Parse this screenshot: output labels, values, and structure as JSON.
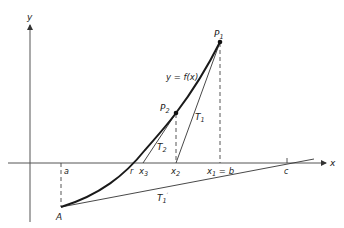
{
  "diagram": {
    "axes": {
      "x_label": "x",
      "y_label": "y"
    },
    "curve_label": "y = f(x)",
    "points": {
      "P1": {
        "label": "P",
        "sub": "1"
      },
      "P2": {
        "label": "P",
        "sub": "2"
      },
      "A": {
        "label": "A"
      }
    },
    "tangents": {
      "T1": {
        "label": "T",
        "sub": "1"
      },
      "T2": {
        "label": "T",
        "sub": "2"
      },
      "T1prime": {
        "label": "T",
        "sub": "1",
        "prime": "′"
      }
    },
    "x_ticks": {
      "a": "a",
      "r": "r",
      "x3": {
        "label": "x",
        "sub": "3"
      },
      "x2": {
        "label": "x",
        "sub": "2"
      },
      "x1b": {
        "label": "x",
        "sub": "1",
        "suffix": " = b"
      },
      "c": "c"
    },
    "colors": {
      "curve": "#1a1a1a",
      "lines": "#333333",
      "axes": "#555555"
    }
  }
}
